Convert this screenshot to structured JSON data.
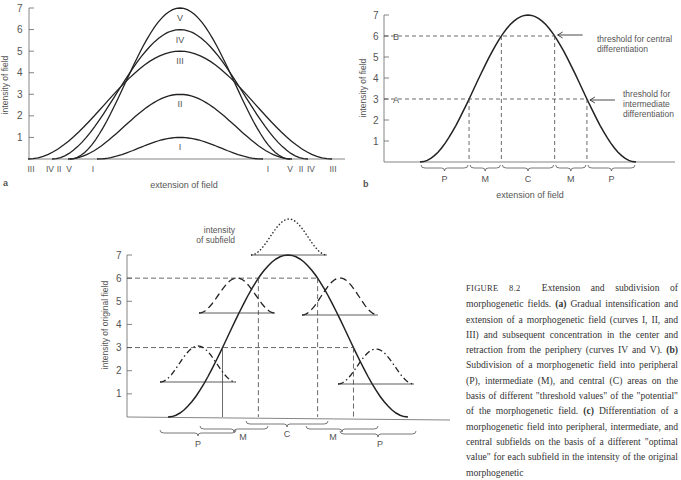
{
  "figure": {
    "panel_a": {
      "label": "a",
      "ylabel": "intensity of field",
      "xlabel": "extension of field",
      "yticks": [
        "1",
        "2",
        "3",
        "4",
        "5",
        "6",
        "7"
      ],
      "curve_labels": [
        "V",
        "IV",
        "III",
        "II",
        "I"
      ],
      "base_labels_left": [
        "III",
        "IV",
        "II",
        "V",
        "I"
      ],
      "base_labels_right": [
        "I",
        "V",
        "II",
        "IV",
        "III"
      ]
    },
    "panel_b": {
      "label": "b",
      "ylabel": "intensity of field",
      "xlabel": "extension of field",
      "yticks": [
        "1",
        "2",
        "3",
        "4",
        "5",
        "6",
        "7"
      ],
      "threshold_B": "B",
      "threshold_A": "A",
      "annotation_central": [
        "threshold for central",
        "differentiation"
      ],
      "annotation_intermediate": [
        "threshold for",
        "intermediate",
        "differentiation"
      ],
      "zones": [
        "P",
        "M",
        "C",
        "M",
        "P"
      ]
    },
    "panel_c": {
      "ylabel": "intensity of original field",
      "yticks": [
        "1",
        "2",
        "3",
        "4",
        "5",
        "6",
        "7"
      ],
      "subfield_label": [
        "intensity",
        "of subfield"
      ],
      "zones": [
        "P",
        "M",
        "C",
        "M",
        "P"
      ]
    },
    "caption": {
      "figure_no": "FIGURE 8.2",
      "title": "Extension and subdivision of morphogenetic fields.",
      "a_label": "(a)",
      "a_text": "Gradual intensification and extension of a morphogenetic field (curves I, II, and III) and subsequent concentration in the center and retraction from the periphery (curves IV and V).",
      "b_label": "(b)",
      "b_text": "Subdivision of a morphogenetic field into peripheral (P), intermediate (M), and central (C) areas on the basis of different \"threshold values\" of the \"potential\" of the morphogenetic field.",
      "c_label": "(c)",
      "c_text": "Differentiation of a morphogenetic field into peripheral, intermediate, and central subfields on the basis of a different \"optimal value\" for each subfield in the intensity of the original morphogenetic"
    }
  },
  "chart_data": [
    {
      "type": "line",
      "title": "a",
      "xlabel": "extension of field",
      "ylabel": "intensity of field",
      "ylim": [
        0,
        7
      ],
      "series": [
        {
          "name": "I",
          "peak": 1,
          "extent": [
            -0.5,
            0.5
          ]
        },
        {
          "name": "II",
          "peak": 3,
          "extent": [
            -0.75,
            0.75
          ]
        },
        {
          "name": "III",
          "peak": 5,
          "extent": [
            -0.9,
            0.9
          ]
        },
        {
          "name": "IV",
          "peak": 6,
          "extent": [
            -0.8,
            0.8
          ]
        },
        {
          "name": "V",
          "peak": 7,
          "extent": [
            -0.7,
            0.7
          ]
        }
      ]
    },
    {
      "type": "line",
      "title": "b",
      "xlabel": "extension of field",
      "ylabel": "intensity of field",
      "ylim": [
        0,
        7
      ],
      "series": [
        {
          "name": "field",
          "peak": 7
        }
      ],
      "thresholds": [
        {
          "label": "A",
          "value": 3
        },
        {
          "label": "B",
          "value": 6
        }
      ],
      "zones": [
        "P",
        "M",
        "C",
        "M",
        "P"
      ]
    },
    {
      "type": "line",
      "title": "c",
      "ylabel": "intensity of original field",
      "ylim": [
        0,
        7
      ],
      "series": [
        {
          "name": "original field",
          "peak": 7
        },
        {
          "name": "central subfield (dotted)",
          "optimal": 7
        },
        {
          "name": "intermediate subfields (dashed)",
          "optimal": 6
        },
        {
          "name": "peripheral subfields (dash-dot)",
          "optimal": 3
        }
      ],
      "zones": [
        "P",
        "M",
        "C",
        "M",
        "P"
      ]
    }
  ]
}
